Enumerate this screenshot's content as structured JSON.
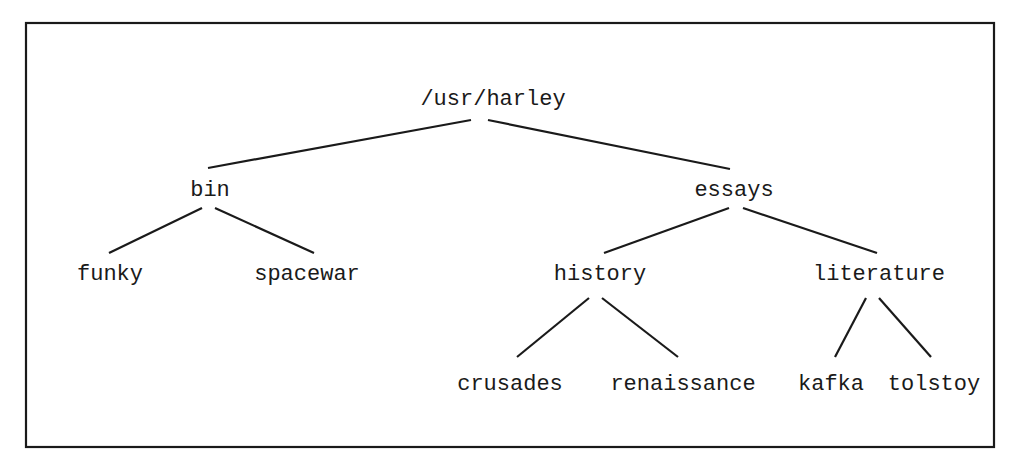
{
  "diagram": {
    "type": "directory-tree",
    "frame": {
      "x": 26,
      "y": 23,
      "width": 968,
      "height": 424
    },
    "nodes": [
      {
        "id": "root",
        "label": "/usr/harley",
        "x": 493,
        "y": 105
      },
      {
        "id": "bin",
        "label": "bin",
        "x": 210,
        "y": 196
      },
      {
        "id": "essays",
        "label": "essays",
        "x": 734,
        "y": 196
      },
      {
        "id": "funky",
        "label": "funky",
        "x": 110,
        "y": 280
      },
      {
        "id": "spacewar",
        "label": "spacewar",
        "x": 307,
        "y": 280
      },
      {
        "id": "history",
        "label": "history",
        "x": 600,
        "y": 280
      },
      {
        "id": "literature",
        "label": "literature",
        "x": 879,
        "y": 280
      },
      {
        "id": "crusades",
        "label": "crusades",
        "x": 510,
        "y": 390
      },
      {
        "id": "renaissance",
        "label": "renaissance",
        "x": 683,
        "y": 390
      },
      {
        "id": "kafka",
        "label": "kafka",
        "x": 831,
        "y": 390
      },
      {
        "id": "tolstoy",
        "label": "tolstoy",
        "x": 934,
        "y": 390
      }
    ],
    "edges": [
      {
        "from": "root",
        "to": "bin",
        "x1": 471,
        "y1": 120,
        "x2": 208,
        "y2": 168
      },
      {
        "from": "root",
        "to": "essays",
        "x1": 488,
        "y1": 120,
        "x2": 730,
        "y2": 169
      },
      {
        "from": "bin",
        "to": "funky",
        "x1": 202,
        "y1": 208,
        "x2": 109,
        "y2": 253
      },
      {
        "from": "bin",
        "to": "spacewar",
        "x1": 215,
        "y1": 208,
        "x2": 314,
        "y2": 253
      },
      {
        "from": "essays",
        "to": "history",
        "x1": 729,
        "y1": 208,
        "x2": 604,
        "y2": 253
      },
      {
        "from": "essays",
        "to": "literature",
        "x1": 743,
        "y1": 208,
        "x2": 877,
        "y2": 253
      },
      {
        "from": "history",
        "to": "crusades",
        "x1": 589,
        "y1": 298,
        "x2": 517,
        "y2": 357
      },
      {
        "from": "history",
        "to": "renaissance",
        "x1": 602,
        "y1": 298,
        "x2": 678,
        "y2": 357
      },
      {
        "from": "literature",
        "to": "kafka",
        "x1": 866,
        "y1": 298,
        "x2": 835,
        "y2": 357
      },
      {
        "from": "literature",
        "to": "tolstoy",
        "x1": 879,
        "y1": 298,
        "x2": 931,
        "y2": 357
      }
    ]
  },
  "colors": {
    "background": "#ffffff",
    "ink": "#1a1a1a"
  }
}
